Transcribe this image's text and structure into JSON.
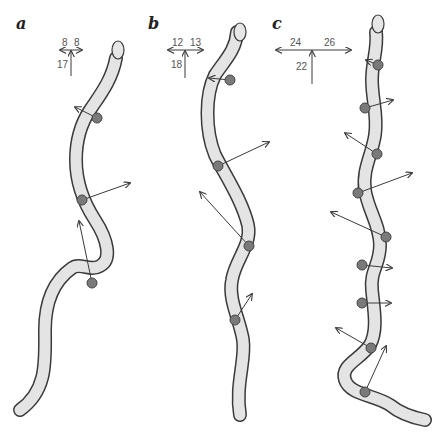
{
  "figure": {
    "panels": [
      {
        "label": "a",
        "force_diagram": {
          "left": "8",
          "right": "8",
          "forward": "17"
        },
        "contact_points": 3
      },
      {
        "label": "b",
        "force_diagram": {
          "left": "12",
          "right": "13",
          "forward": "18"
        },
        "contact_points": 4
      },
      {
        "label": "c",
        "force_diagram": {
          "left": "24",
          "right": "26",
          "forward": "22"
        },
        "contact_points": 9
      }
    ],
    "colors": {
      "snake_fill": "#e4e4e4",
      "snake_outline": "#3a3a3a",
      "contact_point": "#7a7a7a",
      "vector": "#3a3a3a"
    }
  }
}
